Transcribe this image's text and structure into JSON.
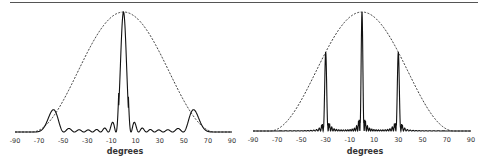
{
  "chart_data": [
    {
      "type": "line",
      "title": "",
      "xlabel": "degrees",
      "ylabel": "",
      "xlim": [
        -90,
        90
      ],
      "ylim": [
        0,
        1
      ],
      "grid": false,
      "legend": null,
      "tick_labels": [
        "-90",
        "-70",
        "-50",
        "-30",
        "-10",
        "10",
        "30",
        "50",
        "70",
        "90"
      ],
      "series": [
        {
          "name": "element pattern (envelope)",
          "style": "dashed",
          "x": [
            -90,
            -75,
            -70,
            -60,
            -50,
            -40,
            -30,
            -20,
            -10,
            0,
            10,
            20,
            30,
            40,
            50,
            60,
            70,
            75,
            90
          ],
          "values": [
            0,
            0,
            0.02,
            0.12,
            0.28,
            0.47,
            0.66,
            0.83,
            0.95,
            1,
            0.95,
            0.83,
            0.66,
            0.47,
            0.28,
            0.12,
            0.02,
            0,
            0
          ]
        },
        {
          "name": "array pattern",
          "style": "solid",
          "x": [
            -90,
            -30,
            -20,
            -15,
            -12,
            -10,
            -8,
            -5,
            -3,
            0,
            3,
            5,
            8,
            10,
            12,
            15,
            20,
            30,
            90
          ],
          "values": [
            0,
            0.005,
            0.01,
            0.03,
            0.02,
            0.06,
            0.02,
            0.01,
            0.5,
            1,
            0.5,
            0.01,
            0.02,
            0.06,
            0.02,
            0.03,
            0.01,
            0.005,
            0
          ]
        }
      ]
    },
    {
      "type": "line",
      "title": "",
      "xlabel": "degrees",
      "ylabel": "",
      "xlim": [
        -90,
        90
      ],
      "ylim": [
        0,
        1
      ],
      "grid": false,
      "legend": null,
      "tick_labels": [
        "-90",
        "-70",
        "-50",
        "-30",
        "-10",
        "10",
        "30",
        "50",
        "70",
        "90"
      ],
      "series": [
        {
          "name": "element pattern (envelope)",
          "style": "dashed",
          "x": [
            -90,
            -75,
            -70,
            -60,
            -50,
            -40,
            -30,
            -20,
            -10,
            0,
            10,
            20,
            30,
            40,
            50,
            60,
            70,
            75,
            90
          ],
          "values": [
            0,
            0,
            0.02,
            0.12,
            0.28,
            0.47,
            0.66,
            0.83,
            0.95,
            1,
            0.95,
            0.83,
            0.66,
            0.47,
            0.28,
            0.12,
            0.02,
            0,
            0
          ]
        },
        {
          "name": "array pattern (grating lobes)",
          "style": "solid",
          "x": [
            -90,
            -32,
            -30,
            -28,
            -2,
            0,
            2,
            28,
            30,
            32,
            90
          ],
          "values": [
            0,
            0.03,
            0.62,
            0.03,
            0.03,
            1,
            0.03,
            0.03,
            0.62,
            0.03,
            0
          ]
        }
      ]
    }
  ],
  "charts": [
    {
      "xlabel": "degrees",
      "ticks": [
        "-90",
        "-70",
        "-50",
        "-30",
        "-10",
        "10",
        "30",
        "50",
        "70",
        "90"
      ]
    },
    {
      "xlabel": "degrees",
      "ticks": [
        "-90",
        "-70",
        "-50",
        "-30",
        "-10",
        "10",
        "30",
        "50",
        "70",
        "90"
      ]
    }
  ]
}
